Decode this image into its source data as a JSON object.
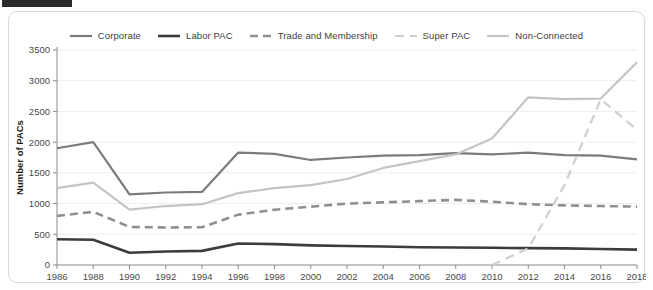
{
  "redaction": {
    "name": "redaction-bar"
  },
  "chart_data": {
    "type": "line",
    "title": "",
    "xlabel": "",
    "ylabel": "Number of PACs",
    "xlim": [
      1986,
      2018
    ],
    "ylim": [
      0,
      3500
    ],
    "grid": true,
    "legend_position": "top-center",
    "categories": [
      1986,
      1988,
      1990,
      1992,
      1994,
      1996,
      1998,
      2000,
      2002,
      2004,
      2006,
      2008,
      2010,
      2012,
      2014,
      2016,
      2018
    ],
    "xtick_labels": [
      "1986",
      "1988",
      "1990",
      "1992",
      "1994",
      "1996",
      "1998",
      "2000",
      "2002",
      "2004",
      "2006",
      "2008",
      "2010",
      "2012",
      "2014",
      "2016",
      "2018"
    ],
    "ytick_labels": [
      "0",
      "500",
      "1000",
      "1500",
      "2000",
      "2500",
      "3000",
      "3500"
    ],
    "ytick_values": [
      0,
      500,
      1000,
      1500,
      2000,
      2500,
      3000,
      3500
    ],
    "series": [
      {
        "name": "Corporate",
        "color": "#7b7b7b",
        "width": 2.2,
        "dash": "none",
        "values": [
          1900,
          2000,
          1150,
          1180,
          1190,
          1830,
          1810,
          1710,
          1750,
          1780,
          1790,
          1820,
          1800,
          1830,
          1790,
          1780,
          1720
        ]
      },
      {
        "name": "Labor PAC",
        "color": "#3c3c3c",
        "width": 2.6,
        "dash": "none",
        "values": [
          420,
          410,
          200,
          220,
          230,
          350,
          340,
          320,
          310,
          300,
          290,
          285,
          280,
          275,
          270,
          260,
          250
        ]
      },
      {
        "name": "Trade and Membership",
        "color": "#8f8f8f",
        "width": 2.6,
        "dash": "8,5",
        "values": [
          800,
          865,
          620,
          610,
          615,
          820,
          900,
          950,
          1000,
          1020,
          1040,
          1060,
          1030,
          990,
          970,
          960,
          950
        ]
      },
      {
        "name": "Super PAC",
        "color": "#cfcfcf",
        "width": 2.2,
        "dash": "9,6",
        "values": [
          null,
          null,
          null,
          null,
          null,
          null,
          null,
          null,
          null,
          null,
          null,
          null,
          0,
          270,
          1300,
          2700,
          2200
        ]
      },
      {
        "name": "Non-Connected",
        "color": "#c4c4c4",
        "width": 2.2,
        "dash": "none",
        "values": [
          1250,
          1340,
          900,
          960,
          990,
          1170,
          1250,
          1300,
          1400,
          1580,
          1690,
          1800,
          2060,
          2730,
          2700,
          2710,
          3300
        ]
      }
    ]
  }
}
